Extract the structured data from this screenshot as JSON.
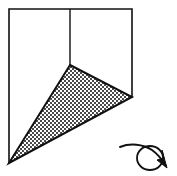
{
  "figure": {
    "title": "Folded square with shaded triangle and rotation arrow",
    "canvas": {
      "width": 177,
      "height": 176,
      "background_color": "#ffffff"
    },
    "colors": {
      "outline": "#111111",
      "fold_line": "#111111",
      "triangle_stroke": "#111111",
      "triangle_fill_dark": "#4a4a4a",
      "triangle_fill_light": "#ffffff",
      "arrow_stroke": "#111111"
    },
    "square": {
      "label": "square-outline",
      "description": "Square drawn with three visible sides; bottom side is not drawn",
      "top_left": [
        9,
        9
      ],
      "top_right": [
        132,
        9
      ],
      "bottom_right": [
        132,
        97
      ],
      "bottom_left": [
        9,
        163
      ],
      "sides_drawn": [
        "left",
        "top",
        "right"
      ],
      "stroke_width": 1.6
    },
    "fold_line": {
      "label": "vertical-fold-line",
      "from": [
        70,
        9
      ],
      "to": [
        70,
        65
      ],
      "stroke_width": 1.4
    },
    "triangle": {
      "label": "shaded-triangle",
      "vertices": [
        [
          70,
          65
        ],
        [
          132,
          97
        ],
        [
          9,
          163
        ]
      ],
      "vertex_names": [
        "apex",
        "right-vertex",
        "bottom-left-vertex"
      ],
      "fill_pattern": "checkerboard-50-percent",
      "pattern_cell_px": 2,
      "stroke_width": 2.0
    },
    "rotation_arrow": {
      "label": "rotation-arrow",
      "direction": "clockwise",
      "loop_center": [
        150,
        158
      ],
      "loop_radius_x": 13,
      "loop_radius_y": 12,
      "tail_start": [
        120,
        147
      ],
      "arrowhead_tip": [
        167,
        166
      ],
      "stroke_width": 2.0
    }
  }
}
